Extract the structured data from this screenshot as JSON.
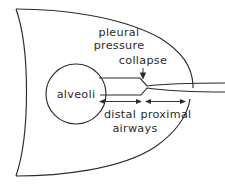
{
  "figure": {
    "background_color": "#ffffff",
    "line_color": "#2b2b2b",
    "labels": {
      "pleural_line1": "pleural",
      "pleural_line2": "pressure",
      "collapse": "collapse",
      "alveoli": "alveoli",
      "distal": "distal",
      "proximal": "proximal",
      "airways": "airways"
    },
    "annotations": {
      "collapse_arrow": "down-arrow-icon",
      "distal_span_arrow": "double-headed-arrow-icon",
      "proximal_span_arrow": "double-headed-arrow-icon"
    },
    "structures": {
      "pleural_space": "lung-outline",
      "alveolus": "alveoli-circle",
      "airway": "airway-tube",
      "narrowing": "collapse-point"
    }
  }
}
